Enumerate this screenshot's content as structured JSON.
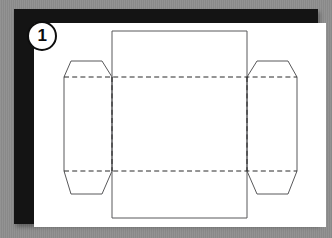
{
  "figure": {
    "step_number": "1",
    "caption": "",
    "background_color": "#8e8e8e",
    "frame_color": "#141414",
    "paper_color": "#ffffff",
    "cut_line_color": "#58585a",
    "fold_line_color": "#2b2b2b"
  },
  "diagram": {
    "type": "technical-dieline",
    "parts": [
      {
        "name": "top-panel",
        "line_style": "solid-cut"
      },
      {
        "name": "center-panel",
        "line_style": "solid-cut"
      },
      {
        "name": "bottom-panel",
        "line_style": "solid-cut"
      },
      {
        "name": "left-side-flap",
        "line_style": "solid-cut"
      },
      {
        "name": "right-side-flap",
        "line_style": "solid-cut"
      },
      {
        "name": "upper-fold-crease",
        "line_style": "dashed-fold"
      },
      {
        "name": "lower-fold-crease",
        "line_style": "dashed-fold"
      },
      {
        "name": "left-fold-crease",
        "line_style": "dashed-fold"
      },
      {
        "name": "right-fold-crease",
        "line_style": "dashed-fold"
      }
    ]
  }
}
